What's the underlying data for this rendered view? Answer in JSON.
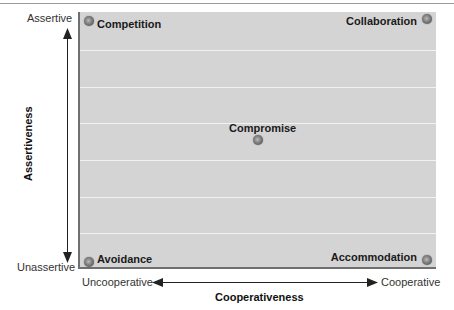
{
  "diagram": {
    "type": "conflict-management-grid",
    "x_axis": {
      "title": "Cooperativeness",
      "low_label": "Uncooperative",
      "high_label": "Cooperative"
    },
    "y_axis": {
      "title": "Assertiveness",
      "low_label": "Unassertive",
      "high_label": "Assertive"
    },
    "styles": [
      {
        "name": "Competition",
        "position": "top-left"
      },
      {
        "name": "Collaboration",
        "position": "top-right"
      },
      {
        "name": "Compromise",
        "position": "center"
      },
      {
        "name": "Avoidance",
        "position": "bottom-left"
      },
      {
        "name": "Accommodation",
        "position": "bottom-right"
      }
    ],
    "colors": {
      "plot_background": "#d4d4d4",
      "grid_lines": "#f2f2f2",
      "axis": "#222222",
      "marker": "#7a7a7a"
    }
  }
}
